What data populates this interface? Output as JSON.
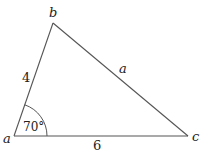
{
  "diagram": {
    "type": "triangle",
    "vertices": {
      "a": {
        "label": "a",
        "x": 14,
        "y": 136
      },
      "b": {
        "label": "b",
        "x": 53,
        "y": 23
      },
      "c": {
        "label": "c",
        "x": 188,
        "y": 136
      }
    },
    "sides": {
      "ab": {
        "label": "4"
      },
      "bc": {
        "label": "a"
      },
      "ac": {
        "label": "6"
      }
    },
    "angle": {
      "vertex": "a",
      "label": "70°"
    },
    "colors": {
      "stroke": "#555555",
      "text": "#222222",
      "background": "#ffffff"
    }
  }
}
